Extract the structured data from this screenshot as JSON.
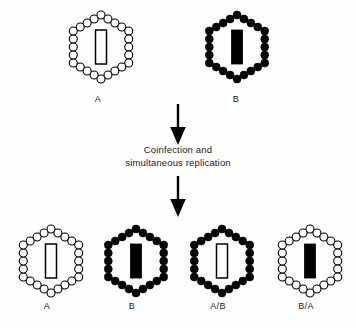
{
  "figure": {
    "background_color": "#fefefe",
    "ink_color": "#000000",
    "width": 356,
    "height": 328
  },
  "process": {
    "step_line_1": "Coinfection and",
    "step_line_2": "simultaneous replication",
    "arrow_top_name": "downward-arrow",
    "arrow_bottom_name": "downward-arrow"
  },
  "parents": [
    {
      "label": "A",
      "capsid_style": "open",
      "genome_style": "open",
      "capsid_fill": "#ffffff",
      "capsid_stroke": "#000000",
      "genome_fill": "#ffffff",
      "genome_stroke": "#000000",
      "x": 62,
      "y": 8,
      "label_x": 98,
      "label_y": 94
    },
    {
      "label": "B",
      "capsid_style": "filled",
      "genome_style": "filled",
      "capsid_fill": "#000000",
      "capsid_stroke": "#000000",
      "genome_fill": "#000000",
      "genome_stroke": "#000000",
      "x": 198,
      "y": 8,
      "label_x": 236,
      "label_y": 94
    }
  ],
  "progeny": [
    {
      "label": "A",
      "capsid_style": "open",
      "genome_style": "open",
      "capsid_fill": "#ffffff",
      "capsid_stroke": "#000000",
      "genome_fill": "#ffffff",
      "genome_stroke": "#000000",
      "x": 12,
      "y": 222,
      "label_x": 47,
      "label_y": 301
    },
    {
      "label": "B",
      "capsid_style": "filled",
      "genome_style": "filled",
      "capsid_fill": "#000000",
      "capsid_stroke": "#000000",
      "genome_fill": "#000000",
      "genome_stroke": "#000000",
      "x": 97,
      "y": 222,
      "label_x": 132,
      "label_y": 301
    },
    {
      "label": "A/B",
      "capsid_style": "filled",
      "genome_style": "open",
      "capsid_fill": "#000000",
      "capsid_stroke": "#000000",
      "genome_fill": "#ffffff",
      "genome_stroke": "#000000",
      "x": 183,
      "y": 222,
      "label_x": 218,
      "label_y": 301
    },
    {
      "label": "B/A",
      "capsid_style": "open",
      "genome_style": "filled",
      "capsid_fill": "#ffffff",
      "capsid_stroke": "#000000",
      "genome_fill": "#000000",
      "genome_stroke": "#000000",
      "x": 271,
      "y": 222,
      "label_x": 306,
      "label_y": 301
    }
  ],
  "geometry": {
    "capsomere_count": 24,
    "capsomere_radius": 4.0,
    "hexagon_radius": 32,
    "genome_width": 11,
    "genome_height": 34
  }
}
